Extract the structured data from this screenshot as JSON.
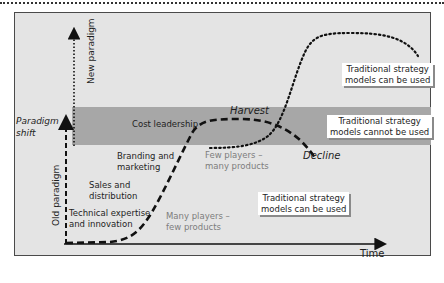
{
  "diagram": {
    "type": "paradigm-shift strategy lifecycle diagram",
    "axes": {
      "x_label": "Time",
      "y_lower_label": "Old paradigm",
      "y_upper_label": "New paradigm"
    },
    "left_label": {
      "line1": "Paradigm",
      "line2": "shift"
    },
    "stages": [
      {
        "line1": "Technical expertise",
        "line2": "and innovation"
      },
      {
        "line1": "Sales and",
        "line2": "distribution"
      },
      {
        "line1": "Branding and",
        "line2": "marketing"
      },
      {
        "line1": "Cost leadership",
        "line2": ""
      }
    ],
    "market_notes": [
      {
        "line1": "Many players –",
        "line2": "few products"
      },
      {
        "line1": "Few players –",
        "line2": "many products"
      }
    ],
    "curve_labels": {
      "harvest": "Harvest",
      "decline": "Decline"
    },
    "callouts": [
      {
        "line1": "Traditional strategy",
        "line2": "models can be used"
      },
      {
        "line1": "Traditional strategy",
        "line2": "models cannot be used"
      },
      {
        "line1": "Traditional strategy",
        "line2": "models can be used"
      }
    ],
    "colors": {
      "panel": "#e4e4e4",
      "band": "#a7a7a7",
      "line": "#111111",
      "grey_text": "#7d7d7d"
    }
  }
}
